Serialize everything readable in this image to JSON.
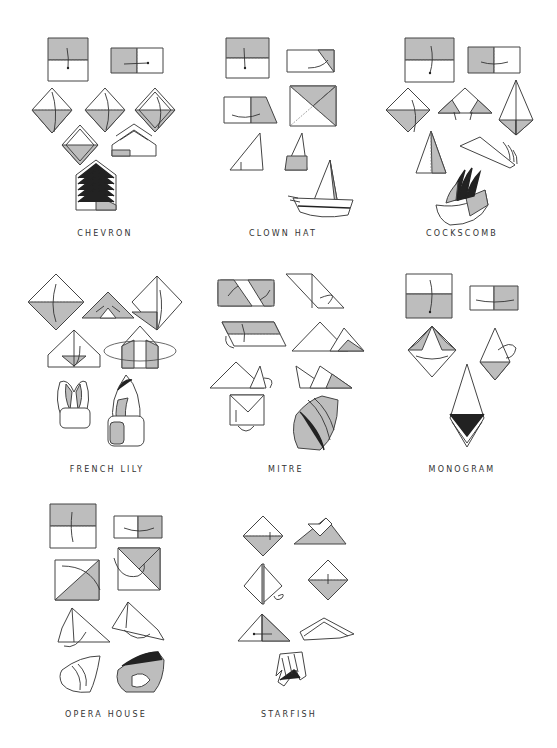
{
  "page": {
    "background": "#ffffff",
    "shade_color": "#bdbdbd",
    "line_color": "#444444"
  },
  "folds": [
    {
      "id": "chevron",
      "label": "CHEVRON",
      "steps": 8
    },
    {
      "id": "clown-hat",
      "label": "CLOWN HAT",
      "steps": 7
    },
    {
      "id": "cockscomb",
      "label": "COCKSCOMB",
      "steps": 8
    },
    {
      "id": "french-lily",
      "label": "FRENCH LILY",
      "steps": 7
    },
    {
      "id": "mitre",
      "label": "MITRE",
      "steps": 8
    },
    {
      "id": "monogram",
      "label": "MONOGRAM",
      "steps": 5
    },
    {
      "id": "opera-house",
      "label": "OPERA HOUSE",
      "steps": 8
    },
    {
      "id": "starfish",
      "label": "STARFISH",
      "steps": 7
    }
  ]
}
